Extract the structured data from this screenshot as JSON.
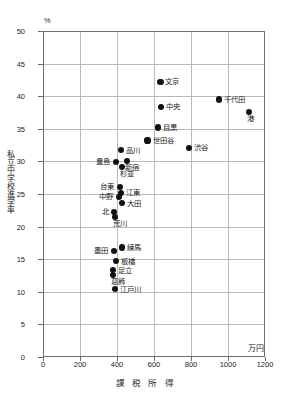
{
  "chart_data": {
    "type": "scatter",
    "title": "",
    "xlabel": "課 税 所 得",
    "ylabel": "私立中学校進学率",
    "x_unit": "万円",
    "y_unit": "%",
    "xlim": [
      0,
      1200
    ],
    "ylim": [
      0,
      50
    ],
    "xticks": [
      0,
      200,
      400,
      600,
      800,
      1000,
      1200
    ],
    "yticks": [
      0,
      5,
      10,
      15,
      20,
      25,
      30,
      35,
      40,
      45,
      50
    ],
    "grid": true,
    "legend": "none",
    "points": [
      {
        "label": "文京",
        "x": 635,
        "y": 42.2,
        "label_pos": "right"
      },
      {
        "label": "千代田",
        "x": 950,
        "y": 39.5,
        "label_pos": "right"
      },
      {
        "label": "中央",
        "x": 640,
        "y": 38.4,
        "label_pos": "right"
      },
      {
        "label": "港",
        "x": 1115,
        "y": 37.6,
        "label_pos": "below"
      },
      {
        "label": "目黒",
        "x": 620,
        "y": 35.2,
        "label_pos": "right"
      },
      {
        "label": "世田谷",
        "x": 565,
        "y": 33.2,
        "label_pos": "right"
      },
      {
        "label": "渋谷",
        "x": 790,
        "y": 32.1,
        "label_pos": "right"
      },
      {
        "label": "品川",
        "x": 420,
        "y": 31.7,
        "label_pos": "right"
      },
      {
        "label": "新宿",
        "x": 455,
        "y": 30.1,
        "label_pos": "below"
      },
      {
        "label": "豊島",
        "x": 395,
        "y": 29.9,
        "label_pos": "left"
      },
      {
        "label": "杉並",
        "x": 425,
        "y": 29.2,
        "label_pos": "below"
      },
      {
        "label": "台東",
        "x": 415,
        "y": 26.1,
        "label_pos": "left"
      },
      {
        "label": "江東",
        "x": 420,
        "y": 25.2,
        "label_pos": "right"
      },
      {
        "label": "中野",
        "x": 412,
        "y": 24.6,
        "label_pos": "left"
      },
      {
        "label": "大田",
        "x": 425,
        "y": 23.6,
        "label_pos": "right"
      },
      {
        "label": "北",
        "x": 385,
        "y": 22.3,
        "label_pos": "left"
      },
      {
        "label": "荒川",
        "x": 390,
        "y": 21.5,
        "label_pos": "below"
      },
      {
        "label": "練馬",
        "x": 425,
        "y": 16.8,
        "label_pos": "right"
      },
      {
        "label": "墨田",
        "x": 385,
        "y": 16.3,
        "label_pos": "left"
      },
      {
        "label": "板橋",
        "x": 395,
        "y": 14.7,
        "label_pos": "right"
      },
      {
        "label": "足立",
        "x": 380,
        "y": 13.3,
        "label_pos": "right"
      },
      {
        "label": "葛飾",
        "x": 378,
        "y": 12.6,
        "label_pos": "below"
      },
      {
        "label": "江戸川",
        "x": 390,
        "y": 10.4,
        "label_pos": "right"
      }
    ]
  }
}
